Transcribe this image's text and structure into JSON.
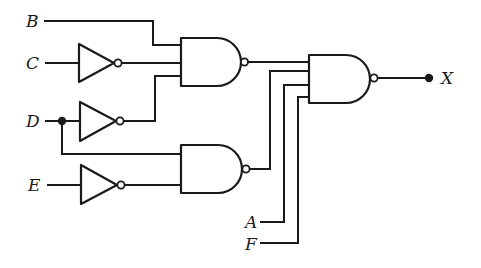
{
  "diagram": {
    "type": "logic-circuit",
    "inputs": [
      "A",
      "B",
      "C",
      "D",
      "E",
      "F"
    ],
    "output": "X",
    "labels": {
      "B": "B",
      "C": "C",
      "D": "D",
      "E": "E",
      "A": "A",
      "F": "F",
      "X": "X"
    },
    "gates": [
      {
        "id": "inv_c",
        "kind": "NOT",
        "input": "C"
      },
      {
        "id": "inv_d",
        "kind": "NOT",
        "input": "D"
      },
      {
        "id": "inv_e",
        "kind": "NOT",
        "input": "E"
      },
      {
        "id": "nand1",
        "kind": "NAND",
        "inputs": [
          "B",
          "NOT C",
          "NOT D"
        ]
      },
      {
        "id": "nand2",
        "kind": "NAND",
        "inputs": [
          "D",
          "NOT E"
        ]
      },
      {
        "id": "nand3",
        "kind": "NAND",
        "inputs": [
          "nand1",
          "nand2",
          "A",
          "F"
        ],
        "output": "X"
      }
    ],
    "colors": {
      "ink": "#1a1a1a",
      "background": "#ffffff"
    }
  }
}
